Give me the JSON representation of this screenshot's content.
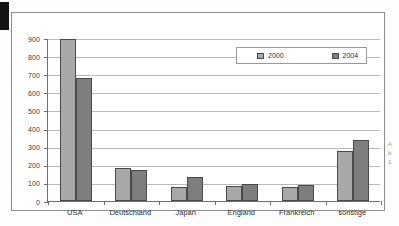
{
  "figure": {
    "frame_visible": true,
    "scan_edge_mark": true
  },
  "legend": {
    "items": [
      {
        "label": "2000",
        "color": "#a8a8a8"
      },
      {
        "label": "2004",
        "color": "#7e7e7e"
      }
    ]
  },
  "axis": {
    "y_ticks": [
      "900",
      "800",
      "700",
      "600",
      "500",
      "400",
      "300",
      "200",
      "100",
      "0"
    ]
  },
  "margin_notes": [
    "A",
    "b",
    "1"
  ],
  "chart_data": {
    "type": "bar",
    "title": "",
    "subtitle": "",
    "xlabel": "",
    "ylabel": "",
    "ylim": [
      0,
      900
    ],
    "ytick_step": 100,
    "grid": true,
    "legend_position": "top-right inside plot",
    "categories": [
      "USA",
      "Deutschland",
      "Japan",
      "England",
      "Frankreich",
      "sonstige"
    ],
    "series": [
      {
        "name": "2000",
        "color": "#a8a8a8",
        "values": [
          895,
          180,
          80,
          85,
          75,
          275
        ]
      },
      {
        "name": "2004",
        "color": "#7e7e7e",
        "values": [
          680,
          170,
          135,
          92,
          87,
          335
        ]
      }
    ]
  }
}
